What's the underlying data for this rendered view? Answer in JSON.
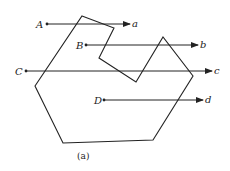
{
  "figure": {
    "caption": "(a)",
    "polygon": "82,16 114,28 99,58 136,82 163,37 193,76 153,140 63,143 35,86",
    "rays": [
      {
        "start_label": "A",
        "end_label": "a",
        "x1": 47,
        "x2": 130,
        "y": 24
      },
      {
        "start_label": "B",
        "end_label": "b",
        "x1": 86,
        "x2": 198,
        "y": 45
      },
      {
        "start_label": "C",
        "end_label": "c",
        "x1": 26,
        "x2": 212,
        "y": 71
      },
      {
        "start_label": "D",
        "end_label": "d",
        "x1": 104,
        "x2": 203,
        "y": 100
      }
    ]
  }
}
